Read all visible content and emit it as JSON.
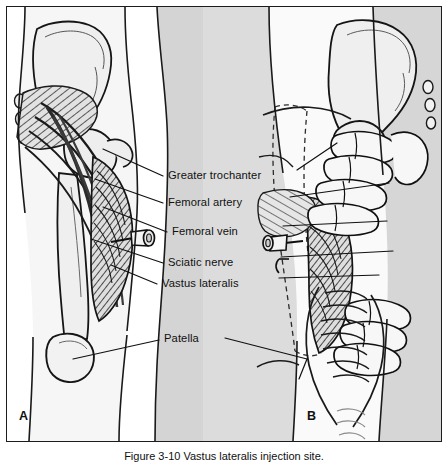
{
  "figure": {
    "panels": [
      {
        "id": "A",
        "letter": "A",
        "name": "anatomical-view"
      },
      {
        "id": "B",
        "letter": "B",
        "name": "technique-view"
      }
    ],
    "labels": [
      {
        "id": "greater-trochanter",
        "text": "Greater trochanter",
        "y": 175
      },
      {
        "id": "femoral-artery",
        "text": "Femoral artery",
        "y": 202
      },
      {
        "id": "femoral-vein",
        "text": "Femoral vein",
        "y": 231
      },
      {
        "id": "sciatic-nerve",
        "text": "Sciatic nerve",
        "y": 262
      },
      {
        "id": "vastus-lateralis",
        "text": "Vastus lateralis",
        "y": 283
      },
      {
        "id": "patella",
        "text": "Patella",
        "y": 338
      }
    ],
    "caption": {
      "prefix": "Figure 3-10",
      "text": "Figure 3-10  Vastus lateralis injection site."
    },
    "colors": {
      "background": "#dcdcdc",
      "border": "#1c1c1c",
      "skin": "#f4f4f4",
      "bone": "#ececec",
      "muscle": "#cfcfcf",
      "ink": "#101010"
    }
  }
}
